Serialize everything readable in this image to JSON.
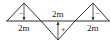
{
  "diagram": {
    "type": "influence-line",
    "baseline_label": "",
    "segments": [
      {
        "label": "2m",
        "sign": "−",
        "direction": "up"
      },
      {
        "label": "2m",
        "sign": "+",
        "direction": "down"
      },
      {
        "label": "2m",
        "sign": "−",
        "direction": "up"
      }
    ],
    "colors": {
      "line": "#333333",
      "text": "#222222",
      "background": "#ffffff"
    }
  }
}
